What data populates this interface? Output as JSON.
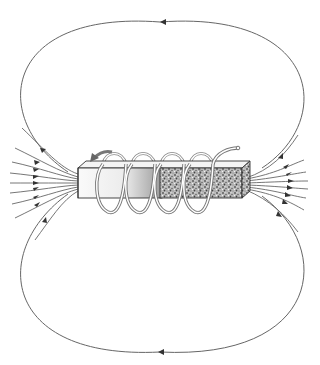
{
  "diagram": {
    "title": "Magnetic field lines of a solenoid with iron core (electromagnet)",
    "elements": {
      "core": "rectangular-bar-core",
      "coil": "helical-wire-coil",
      "coil_turns": 5,
      "current_direction_arrow": "curved-arrow-on-first-turn",
      "field_lines_left": 9,
      "field_lines_right": 9,
      "outer_loops": [
        "top-loop",
        "bottom-loop"
      ]
    },
    "arrow_directions": {
      "left_side": "toward-magnet",
      "right_side": "away-from-magnet",
      "top_loop": "right-to-left",
      "bottom_loop": "right-to-left"
    },
    "colors": {
      "line": "#555555",
      "core_left": "#f2f2f2",
      "core_right_textured": "#8a8a8a",
      "coil": "#777777",
      "background": "#ffffff"
    }
  }
}
